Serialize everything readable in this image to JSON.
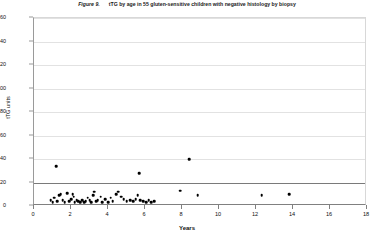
{
  "figure": {
    "number": "Figure 9.",
    "caption": "tTG  by age in 55 gluten-sensitive children with negative histology by biopsy"
  },
  "chart_data": {
    "type": "scatter",
    "title": "tTG  by age in 55 gluten-sensitive children with negative histology by biopsy",
    "xlabel": "Years",
    "ylabel": "tTG units",
    "xlim": [
      0,
      18
    ],
    "ylim": [
      0,
      160
    ],
    "xticks": [
      0,
      2,
      4,
      6,
      8,
      10,
      12,
      14,
      16,
      18
    ],
    "yticks": [
      0,
      20,
      40,
      60,
      80,
      100,
      120,
      140,
      160
    ],
    "grid": "horizontal",
    "legend": "none",
    "n_points": 55,
    "reference_line": {
      "axis": "y",
      "value": 20,
      "label": ""
    },
    "points": [
      {
        "x": 1.2,
        "y": 34
      },
      {
        "x": 0.9,
        "y": 5
      },
      {
        "x": 1.0,
        "y": 3
      },
      {
        "x": 1.1,
        "y": 7
      },
      {
        "x": 1.25,
        "y": 4
      },
      {
        "x": 1.35,
        "y": 9
      },
      {
        "x": 1.45,
        "y": 10
      },
      {
        "x": 1.55,
        "y": 5
      },
      {
        "x": 1.65,
        "y": 3
      },
      {
        "x": 1.8,
        "y": 11
      },
      {
        "x": 1.9,
        "y": 4
      },
      {
        "x": 2.0,
        "y": 6
      },
      {
        "x": 2.1,
        "y": 10
      },
      {
        "x": 2.2,
        "y": 3
      },
      {
        "x": 2.3,
        "y": 5
      },
      {
        "x": 2.4,
        "y": 4
      },
      {
        "x": 2.5,
        "y": 3
      },
      {
        "x": 2.6,
        "y": 5
      },
      {
        "x": 2.7,
        "y": 3
      },
      {
        "x": 2.8,
        "y": 4
      },
      {
        "x": 2.9,
        "y": 7
      },
      {
        "x": 3.0,
        "y": 5
      },
      {
        "x": 3.1,
        "y": 3
      },
      {
        "x": 3.2,
        "y": 9
      },
      {
        "x": 3.25,
        "y": 12
      },
      {
        "x": 3.35,
        "y": 4
      },
      {
        "x": 3.45,
        "y": 5
      },
      {
        "x": 3.6,
        "y": 8
      },
      {
        "x": 3.7,
        "y": 3
      },
      {
        "x": 3.85,
        "y": 6
      },
      {
        "x": 4.0,
        "y": 3
      },
      {
        "x": 4.25,
        "y": 4
      },
      {
        "x": 4.45,
        "y": 10
      },
      {
        "x": 4.55,
        "y": 12
      },
      {
        "x": 4.7,
        "y": 8
      },
      {
        "x": 4.85,
        "y": 6
      },
      {
        "x": 5.0,
        "y": 4
      },
      {
        "x": 5.2,
        "y": 5
      },
      {
        "x": 5.35,
        "y": 4
      },
      {
        "x": 5.5,
        "y": 6
      },
      {
        "x": 5.6,
        "y": 9
      },
      {
        "x": 5.7,
        "y": 28
      },
      {
        "x": 5.75,
        "y": 5
      },
      {
        "x": 5.9,
        "y": 4
      },
      {
        "x": 6.05,
        "y": 3
      },
      {
        "x": 6.2,
        "y": 5
      },
      {
        "x": 6.35,
        "y": 3
      },
      {
        "x": 6.5,
        "y": 4
      },
      {
        "x": 7.9,
        "y": 13
      },
      {
        "x": 8.4,
        "y": 40
      },
      {
        "x": 8.85,
        "y": 9
      },
      {
        "x": 12.3,
        "y": 9
      },
      {
        "x": 13.8,
        "y": 10
      },
      {
        "x": 4.15,
        "y": 7
      },
      {
        "x": 2.15,
        "y": 8
      }
    ]
  }
}
